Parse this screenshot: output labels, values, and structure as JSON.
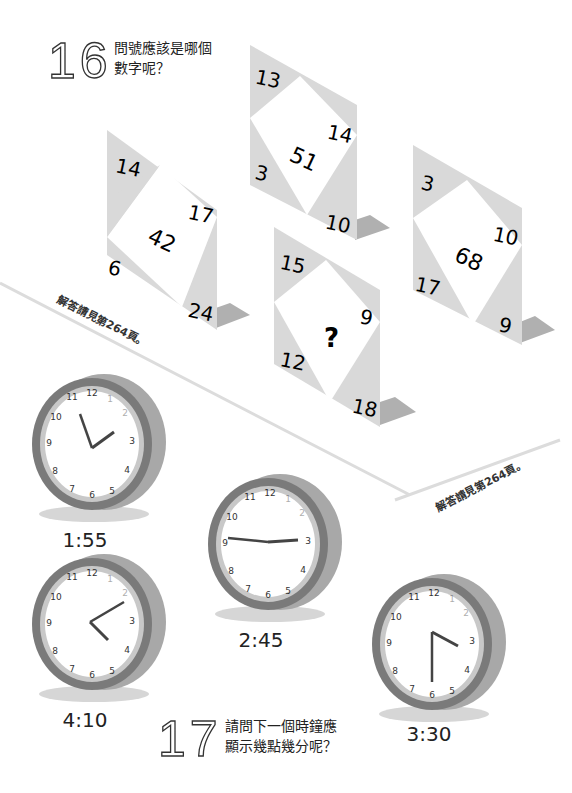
{
  "puzzle16": {
    "number": "16",
    "question_line1": "問號應該是哪個",
    "question_line2": "數字呢？",
    "answer_note": "解答請見第264頁。",
    "cards": [
      {
        "id": "card-a",
        "top_left": "14",
        "right": "17",
        "left_bottom": "6",
        "bottom_right": "24",
        "center": "42"
      },
      {
        "id": "card-b",
        "top_left": "13",
        "right": "14",
        "left_bottom": "3",
        "bottom_right": "10",
        "center": "51"
      },
      {
        "id": "card-c",
        "top_left": "15",
        "right": "9",
        "left_bottom": "12",
        "bottom_right": "18",
        "center": "?"
      },
      {
        "id": "card-d",
        "top_left": "3",
        "right": "10",
        "left_bottom": "17",
        "bottom_right": "9",
        "center": "68"
      }
    ]
  },
  "puzzle17": {
    "number": "17",
    "question_line1": "請問下一個時鐘應",
    "question_line2": "顯示幾點幾分呢？",
    "answer_note": "解答請見第264頁。",
    "clocks": [
      {
        "id": "clock-1",
        "label": "1:55"
      },
      {
        "id": "clock-2",
        "label": "2:45"
      },
      {
        "id": "clock-3",
        "label": "4:10"
      },
      {
        "id": "clock-4",
        "label": "3:30"
      }
    ],
    "dial_numbers": [
      "12",
      "1",
      "2",
      "3",
      "4",
      "5",
      "6",
      "7",
      "8",
      "9",
      "10",
      "11"
    ]
  },
  "colors": {
    "card_gray": "#d9d9d9",
    "card_shadow": "#b8b8b8",
    "clock_rim": "#7a7a7a",
    "clock_side": "#a8a8a8",
    "floor_line": "#d8d8d8"
  }
}
